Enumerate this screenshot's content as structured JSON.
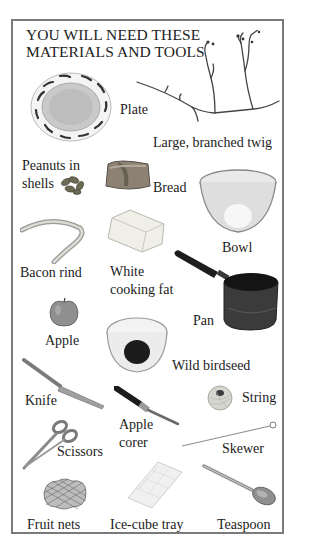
{
  "page": {
    "title_line1": "YOU WILL NEED THESE",
    "title_line2": "MATERIALS AND TOOLS"
  },
  "items": [
    {
      "id": "plate",
      "label": "Plate",
      "icon": "plate-icon"
    },
    {
      "id": "twig",
      "label": "Large, branched twig",
      "icon": "twig-icon"
    },
    {
      "id": "peanuts",
      "label_line1": "Peanuts in",
      "label_line2": "shells",
      "icon": "peanuts-icon"
    },
    {
      "id": "bread",
      "label": "Bread",
      "icon": "bread-icon"
    },
    {
      "id": "bowl",
      "label": "Bowl",
      "icon": "bowl-icon"
    },
    {
      "id": "bacon",
      "label": "Bacon rind",
      "icon": "bacon-rind-icon"
    },
    {
      "id": "fat",
      "label_line1": "White",
      "label_line2": "cooking fat",
      "icon": "cooking-fat-icon"
    },
    {
      "id": "pan",
      "label": "Pan",
      "icon": "pan-icon"
    },
    {
      "id": "apple",
      "label": "Apple",
      "icon": "apple-icon"
    },
    {
      "id": "birdseed",
      "label": "Wild birdseed",
      "icon": "birdseed-icon"
    },
    {
      "id": "knife",
      "label": "Knife",
      "icon": "knife-icon"
    },
    {
      "id": "corer",
      "label_line1": "Apple",
      "label_line2": "corer",
      "icon": "apple-corer-icon"
    },
    {
      "id": "string",
      "label": "String",
      "icon": "string-icon"
    },
    {
      "id": "scissors",
      "label": "Scissors",
      "icon": "scissors-icon"
    },
    {
      "id": "skewer",
      "label": "Skewer",
      "icon": "skewer-icon"
    },
    {
      "id": "nets",
      "label": "Fruit nets",
      "icon": "fruit-nets-icon"
    },
    {
      "id": "tray",
      "label": "Ice-cube tray",
      "icon": "ice-cube-tray-icon"
    },
    {
      "id": "teaspoon",
      "label": "Teaspoon",
      "icon": "teaspoon-icon"
    }
  ],
  "colors": {
    "frame_border": "#7a7a7a",
    "text": "#1b1b1b",
    "background": "#ffffff"
  }
}
